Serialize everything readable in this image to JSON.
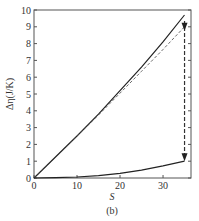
{
  "chart_data": {
    "type": "line",
    "title": "",
    "caption": "(b)",
    "xlabel": "S",
    "ylabel": "Δη(J/K)",
    "xlim": [
      0,
      36.5
    ],
    "ylim": [
      0,
      10
    ],
    "grid": false,
    "legend": null,
    "x_ticks": [
      0,
      10,
      20,
      30
    ],
    "y_ticks": [
      0,
      1,
      2,
      3,
      4,
      5,
      6,
      7,
      8,
      9,
      10
    ],
    "series": [
      {
        "name": "upper-solid",
        "style": "solid",
        "x": [
          0,
          5,
          10,
          15,
          20,
          25,
          30,
          35
        ],
        "y": [
          0,
          1.25,
          2.5,
          3.8,
          5.2,
          6.6,
          8.1,
          9.7
        ]
      },
      {
        "name": "dashed-linear",
        "style": "dashed",
        "x": [
          0,
          5,
          10,
          15,
          20,
          25,
          30,
          35
        ],
        "y": [
          0,
          1.25,
          2.5,
          3.75,
          5.05,
          6.35,
          7.65,
          9.0
        ]
      },
      {
        "name": "lower-solid",
        "style": "solid",
        "x": [
          0,
          5,
          10,
          15,
          20,
          25,
          30,
          35
        ],
        "y": [
          0,
          0.02,
          0.06,
          0.14,
          0.28,
          0.47,
          0.72,
          1.0
        ]
      }
    ],
    "annotations": [
      {
        "type": "dashed-arrow",
        "x": 35,
        "y_from": 9.7,
        "y_to": 1.0,
        "direction": "down"
      },
      {
        "type": "arrowhead",
        "x": 35,
        "y": 9.0,
        "direction": "down"
      }
    ]
  }
}
